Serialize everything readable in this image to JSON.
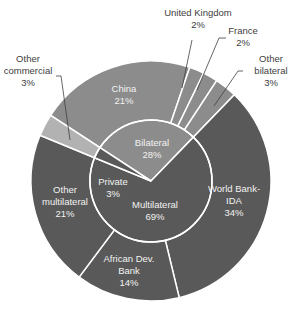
{
  "chart_data": {
    "type": "pie",
    "subtype": "two-level donut (sunburst)",
    "title": "",
    "center": [
      151,
      181
    ],
    "outer_radius": 120,
    "inner_radius": 61,
    "start_angle_deg": 303.2,
    "inner_ring": [
      {
        "name": "Bilateral",
        "value": 28,
        "label": [
          "Bilateral",
          "28%"
        ],
        "color": "#8c8c8c",
        "label_pos": [
          152,
          146
        ]
      },
      {
        "name": "Multilateral",
        "value": 69,
        "label": [
          "Multilateral",
          "69%"
        ],
        "color": "#595959",
        "label_pos": [
          155,
          208
        ]
      },
      {
        "name": "Private",
        "value": 3,
        "label": [
          "Private",
          "3%"
        ],
        "color": "#595959",
        "label_pos": [
          113,
          185
        ]
      }
    ],
    "outer_ring": [
      {
        "name": "China",
        "parent": "Bilateral",
        "value": 21,
        "label": [
          "China",
          "21%"
        ],
        "color": "#8c8c8c",
        "label_pos": [
          124,
          92
        ],
        "inside": true
      },
      {
        "name": "United Kingdom",
        "parent": "Bilateral",
        "value": 2,
        "label": [
          "United Kingdom",
          "2%"
        ],
        "color": "#8c8c8c",
        "label_pos": [
          198,
          16
        ],
        "inside": false,
        "leader": [
          [
            192,
            40
          ],
          [
            182,
            88
          ]
        ]
      },
      {
        "name": "France",
        "parent": "Bilateral",
        "value": 2,
        "label": [
          "France",
          "2%"
        ],
        "color": "#8c8c8c",
        "label_pos": [
          243,
          34
        ],
        "inside": false,
        "leader": [
          [
            226,
            38
          ],
          [
            219,
            38
          ],
          [
            197,
            90
          ]
        ]
      },
      {
        "name": "Other bilateral",
        "parent": "Bilateral",
        "value": 3,
        "label": [
          "Other",
          "bilateral",
          "3%"
        ],
        "color": "#8c8c8c",
        "label_pos": [
          271,
          62
        ],
        "inside": false,
        "leader": [
          [
            243,
            71
          ],
          [
            238,
            71
          ],
          [
            214,
            106
          ]
        ]
      },
      {
        "name": "World Bank-IDA",
        "parent": "Multilateral",
        "value": 34,
        "label": [
          "World Bank-",
          "IDA",
          "34%"
        ],
        "color": "#595959",
        "label_pos": [
          234,
          192
        ],
        "inside": true
      },
      {
        "name": "African Dev. Bank",
        "parent": "Multilateral",
        "value": 14,
        "label": [
          "African Dev.",
          "Bank",
          "14%"
        ],
        "color": "#595959",
        "label_pos": [
          129,
          262
        ],
        "inside": true
      },
      {
        "name": "Other multilateral",
        "parent": "Multilateral",
        "value": 21,
        "label": [
          "Other",
          "multilateral",
          "21%"
        ],
        "color": "#595959",
        "label_pos": [
          65,
          193
        ],
        "inside": true
      },
      {
        "name": "Other commercial",
        "parent": "Private",
        "value": 3,
        "label": [
          "Other",
          "commercial",
          "3%"
        ],
        "color": "#b2b2b2",
        "label_pos": [
          28,
          62
        ],
        "inside": false,
        "leader": [
          [
            56,
            76
          ],
          [
            61,
            76
          ],
          [
            70,
            140
          ]
        ]
      }
    ],
    "legend": "none",
    "separator_color": "#ffffff"
  }
}
